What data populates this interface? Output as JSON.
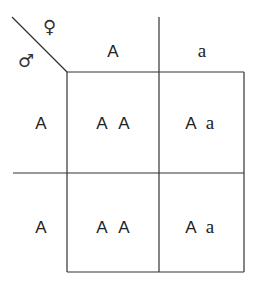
{
  "header": {
    "female_symbol": "♀",
    "male_symbol": "♂",
    "columns": [
      "A",
      "a"
    ]
  },
  "rows": [
    {
      "label": "A",
      "cells": [
        {
          "first": "A",
          "second": "A"
        },
        {
          "first": "A",
          "second": "a"
        }
      ]
    },
    {
      "label": "A",
      "cells": [
        {
          "first": "A",
          "second": "A"
        },
        {
          "first": "A",
          "second": "a"
        }
      ]
    }
  ]
}
